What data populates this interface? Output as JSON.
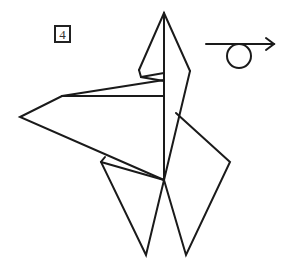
{
  "step": {
    "number": "4"
  },
  "symbol": {
    "name": "turn-over",
    "description": "Arrow with loop: turn model over"
  },
  "colors": {
    "stroke": "#1a1a1a",
    "background": "#ffffff"
  }
}
